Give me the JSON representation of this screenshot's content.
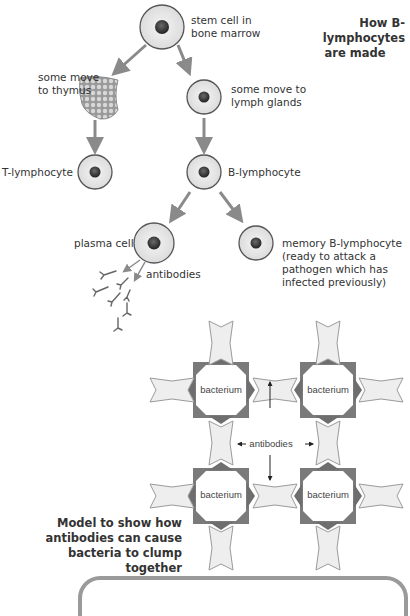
{
  "diagram1": {
    "title_line1": "How B-lymphocytes",
    "title_line2": "are made",
    "stem_cell_line1": "stem cell in",
    "stem_cell_line2": "bone marrow",
    "thymus_line1": "some move",
    "thymus_line2": "to thymus",
    "lymph_line1": "some move to",
    "lymph_line2": "lymph glands",
    "t_lymphocyte": "T-lymphocyte",
    "b_lymphocyte": "B-lymphocyte",
    "plasma_cell": "plasma cell",
    "antibodies": "antibodies",
    "memory_line1": "memory B-lymphocyte",
    "memory_line2": "(ready to attack a",
    "memory_line3": "pathogen which has",
    "memory_line4": "infected previously)"
  },
  "diagram2": {
    "bacterium_labels": [
      "bacterium",
      "bacterium",
      "bacterium",
      "bacterium"
    ],
    "antibodies_label": "antibodies",
    "caption_line1": "Model to show how",
    "caption_line2": "antibodies can cause",
    "caption_line3": "bacteria to clump together"
  },
  "colors": {
    "arrow": "#8a8a8a",
    "cell_border": "#555555",
    "nucleus": "#3a3a3a",
    "bacterium_dark": "#7a7a7a",
    "antibody_fill": "#eeeeee",
    "panel_border": "#9a9a9a"
  }
}
